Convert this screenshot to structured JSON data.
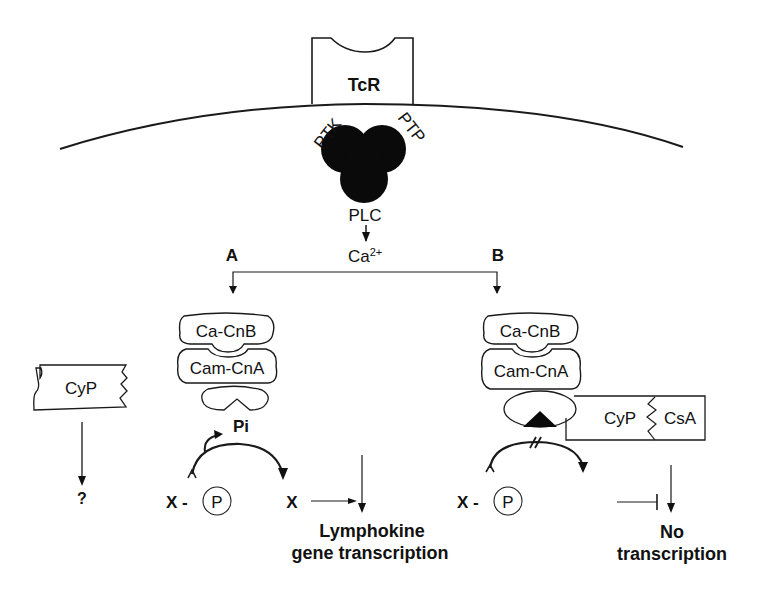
{
  "diagram": {
    "type": "signaling-pathway",
    "receptor": {
      "label": "TcR"
    },
    "membrane_complex": {
      "left_label": "PTK",
      "right_label": "PTP",
      "bottom_label": "PLC"
    },
    "second_messenger": {
      "label": "Ca",
      "superscript": "2+"
    },
    "branches": {
      "a": {
        "label": "A"
      },
      "b": {
        "label": "B"
      }
    },
    "side_panel": {
      "protein": "CyP",
      "outcome": "?"
    },
    "pathway_a": {
      "subunit_top": "Ca-CnB",
      "subunit_bottom": "Cam-CnA",
      "phosphate": "Pi",
      "substrate_phospho_x": "X -",
      "substrate_phospho_p": "P",
      "product": "X",
      "outcome_line1": "Lymphokine",
      "outcome_line2": "gene transcription"
    },
    "pathway_b": {
      "subunit_top": "Ca-CnB",
      "subunit_bottom": "Cam-CnA",
      "inhibitor_left": "CyP",
      "inhibitor_right": "CsA",
      "substrate_phospho_x": "X -",
      "substrate_phospho_p": "P",
      "outcome_line1": "No",
      "outcome_line2": "transcription"
    },
    "colors": {
      "ink": "#111111",
      "background": "#ffffff"
    }
  }
}
